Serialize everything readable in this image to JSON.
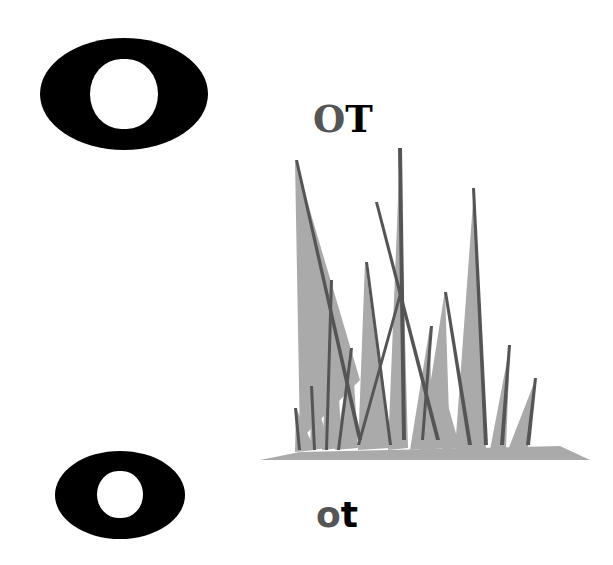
{
  "letter": {
    "uppercase": "O",
    "lowercase": "o"
  },
  "word_upper": {
    "first": "O",
    "rest": "T"
  },
  "word_lower": {
    "first": "o",
    "rest": "t"
  },
  "illustration": {
    "subject": "grass",
    "colors": {
      "light": "#aaaaaa",
      "dark": "#555555"
    }
  },
  "colors": {
    "letter": "#000000",
    "highlight": "#555555",
    "background": "#ffffff"
  }
}
